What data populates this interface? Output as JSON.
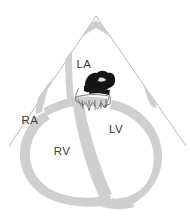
{
  "figure": {
    "name": "apical-four-chamber-echocardiogram-diagram",
    "background_color": "#ffffff",
    "width": 190,
    "height": 216
  },
  "colors": {
    "myocardium_gray": "#cfcfcf",
    "myocardium_gray_light": "#d8d8d8",
    "sector_line": "#b0b0b0",
    "outline": "#9a9a9a",
    "valve_outline": "#6e6e6e",
    "mass_black": "#111111",
    "label_text": "#3a3a3a",
    "background": "#ffffff"
  },
  "sector": {
    "name": "ultrasound-sector-cone",
    "apex": {
      "x": 96,
      "y": 16
    },
    "left_edge_end": {
      "x": 9,
      "y": 146
    },
    "right_edge_end": {
      "x": 186,
      "y": 146
    },
    "stroke_width": 0.9
  },
  "labels": [
    {
      "id": "la",
      "text": "LA",
      "x": 84,
      "y": 68,
      "chamber": "left-atrium"
    },
    {
      "id": "ra",
      "text": "RA",
      "x": 30,
      "y": 124,
      "chamber": "right-atrium"
    },
    {
      "id": "lv",
      "text": "LV",
      "x": 116,
      "y": 133,
      "chamber": "left-ventricle"
    },
    {
      "id": "rv",
      "text": "RV",
      "x": 62,
      "y": 155,
      "chamber": "right-ventricle"
    }
  ],
  "structures": [
    {
      "id": "myocardium",
      "label": "Myocardial wall",
      "fill": "#cfcfcf"
    },
    {
      "id": "interventricular-septum",
      "label": "Interventricular septum",
      "fill": "#cfcfcf"
    },
    {
      "id": "interatrial-septum",
      "label": "Interatrial septum",
      "fill": "#cfcfcf"
    },
    {
      "id": "mitral-valve",
      "label": "Mitral valve leaflets",
      "fill": "none"
    },
    {
      "id": "mass",
      "label": "Mass at mitral valve",
      "fill": "#111111"
    }
  ]
}
